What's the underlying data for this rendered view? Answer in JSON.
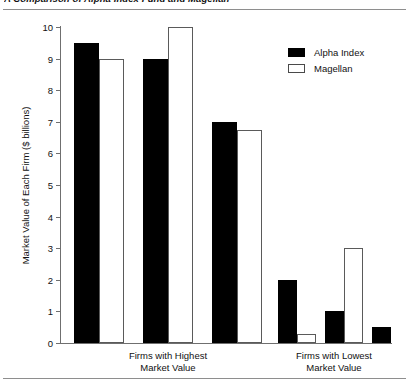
{
  "figure": {
    "title": "A Comparison of Alpha Index Fund and Magellan"
  },
  "legend": {
    "position": "top-right",
    "items": [
      {
        "label": "Alpha Index",
        "swatch": "filled-black-swatch",
        "color": "#000000"
      },
      {
        "label": "Magellan",
        "swatch": "open-white-swatch",
        "color": "#ffffff"
      }
    ]
  },
  "axes": {
    "ylabel": "Market Value of Each Firm ($ billions)",
    "yticks": [
      "0",
      "1",
      "2",
      "3",
      "4",
      "5",
      "6",
      "7",
      "8",
      "9",
      "10"
    ],
    "groups": [
      {
        "line1": "Firms with Highest",
        "line2": "Market Value"
      },
      {
        "line1": "Firms with Lowest",
        "line2": "Market Value"
      }
    ]
  },
  "chart_data": {
    "type": "bar",
    "title": "A Comparison of Alpha Index Fund and Magellan",
    "xlabel": "",
    "ylabel": "Market Value of Each Firm ($ billions)",
    "ylim": [
      0,
      10
    ],
    "yticks": [
      0,
      1,
      2,
      3,
      4,
      5,
      6,
      7,
      8,
      9,
      10
    ],
    "grid": false,
    "legend_position": "top-right",
    "group_labels": [
      "Firms with Highest Market Value",
      "Firms with Lowest Market Value"
    ],
    "categories": [
      "Highest 1",
      "Highest 2",
      "Highest 3",
      "Lowest 1",
      "Lowest 2",
      "Lowest 3"
    ],
    "series": [
      {
        "name": "Alpha Index",
        "color": "#000000",
        "values": [
          9.5,
          9.0,
          7.0,
          2.0,
          1.0,
          0.5
        ]
      },
      {
        "name": "Magellan",
        "color": "#ffffff",
        "values": [
          9.0,
          10.0,
          6.75,
          0.3,
          3.0,
          0.0
        ]
      }
    ]
  },
  "bars": [
    {
      "name": "highest-1-alpha",
      "series": "Alpha Index",
      "value": 9.5,
      "x": 14,
      "w": 25
    },
    {
      "name": "highest-1-magellan",
      "series": "Magellan",
      "value": 9.0,
      "x": 39,
      "w": 25
    },
    {
      "name": "highest-2-alpha",
      "series": "Alpha Index",
      "value": 9.0,
      "x": 83,
      "w": 25
    },
    {
      "name": "highest-2-magellan",
      "series": "Magellan",
      "value": 10.0,
      "x": 108,
      "w": 25
    },
    {
      "name": "highest-3-alpha",
      "series": "Alpha Index",
      "value": 7.0,
      "x": 152,
      "w": 25
    },
    {
      "name": "highest-3-magellan",
      "series": "Magellan",
      "value": 6.75,
      "x": 177,
      "w": 25
    },
    {
      "name": "lowest-1-alpha",
      "series": "Alpha Index",
      "value": 2.0,
      "x": 218,
      "w": 19
    },
    {
      "name": "lowest-1-magellan",
      "series": "Magellan",
      "value": 0.3,
      "x": 237,
      "w": 19
    },
    {
      "name": "lowest-2-alpha",
      "series": "Alpha Index",
      "value": 1.0,
      "x": 265,
      "w": 19
    },
    {
      "name": "lowest-2-magellan",
      "series": "Magellan",
      "value": 3.0,
      "x": 284,
      "w": 19
    },
    {
      "name": "lowest-3-alpha",
      "series": "Alpha Index",
      "value": 0.5,
      "x": 312,
      "w": 19
    }
  ]
}
